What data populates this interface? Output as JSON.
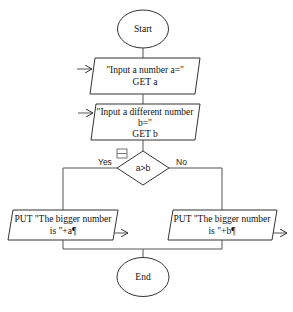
{
  "flowchart": {
    "start": {
      "label": "Start"
    },
    "input_a": {
      "line1": "\"Input a number a=\"",
      "line2": "GET a"
    },
    "input_b": {
      "line1": "\"Input a different number",
      "line2": "b=\"",
      "line3": "GET b"
    },
    "decision": {
      "condition": "a>b",
      "yes_label": "Yes",
      "no_label": "No"
    },
    "output_a": {
      "line1": "PUT \"The bigger number",
      "line2": "is \"+a¶"
    },
    "output_b": {
      "line1": "PUT \"The bigger number",
      "line2": "is \"+b¶"
    },
    "end": {
      "label": "End"
    }
  },
  "colors": {
    "stroke": "#333333",
    "background": "#ffffff",
    "text": "#111111"
  }
}
